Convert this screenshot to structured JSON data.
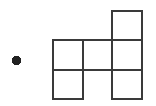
{
  "figure": {
    "canvas": {
      "width": 156,
      "height": 106,
      "background": "#ffffff"
    },
    "stroke": {
      "color": "#3a3a3a",
      "width": 2
    },
    "grid": {
      "cell_size": 29.5,
      "origin_x": 53,
      "origin_y": 40,
      "columns": 3,
      "rows": 3,
      "column_edges": [
        53,
        82.5,
        112,
        141.5
      ],
      "row_edges": [
        40,
        69.5,
        99
      ],
      "occupied_cells": [
        {
          "row": 0,
          "col": 2
        },
        {
          "row": 1,
          "col": 0
        },
        {
          "row": 1,
          "col": 1
        },
        {
          "row": 1,
          "col": 2
        },
        {
          "row": 2,
          "col": 0
        },
        {
          "row": 2,
          "col": 2
        }
      ],
      "square_count": 6
    },
    "point": {
      "label": "dot",
      "center_x": 16.5,
      "center_y": 60.5,
      "radius": 4.6,
      "fill": "#222222"
    }
  }
}
